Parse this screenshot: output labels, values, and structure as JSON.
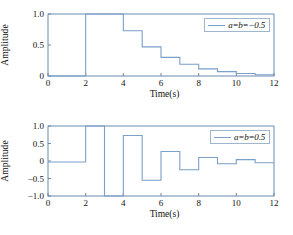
{
  "figure": {
    "background": "#ffffff",
    "line_color": "#7a9fc9",
    "axis_color": "#5b7fa6"
  },
  "chart_data": [
    {
      "type": "line",
      "id": "top",
      "title": "",
      "xlabel": "Time(s)",
      "ylabel": "Amplitude",
      "xlim": [
        0,
        12
      ],
      "ylim": [
        0,
        1.0
      ],
      "xticks": [
        0,
        2,
        4,
        6,
        8,
        10,
        12
      ],
      "xticklabels": [
        "0",
        "2",
        "4",
        "6",
        "8",
        "10",
        "12"
      ],
      "yticks": [
        0,
        0.5,
        1.0
      ],
      "yticklabels": [
        "0",
        "0.5",
        "1.0"
      ],
      "grid": false,
      "drawstyle": "steps-post",
      "legend": {
        "position": "upper right",
        "entries": [
          "a=b=−0.5"
        ]
      },
      "series": [
        {
          "name": "a=b=−0.5",
          "color": "#7a9fc9",
          "x": [
            0,
            1,
            2,
            3,
            4,
            5,
            6,
            7,
            8,
            9,
            10,
            11,
            12
          ],
          "values": [
            0,
            0,
            1.0,
            1.0,
            0.73,
            0.47,
            0.3,
            0.19,
            0.115,
            0.07,
            0.04,
            0.02,
            0.02
          ]
        }
      ]
    },
    {
      "type": "line",
      "id": "bottom",
      "title": "",
      "xlabel": "Time(s)",
      "ylabel": "Amplitude",
      "xlim": [
        0,
        12
      ],
      "ylim": [
        -1.0,
        1.0
      ],
      "xticks": [
        0,
        2,
        4,
        6,
        8,
        10,
        12
      ],
      "xticklabels": [
        "0",
        "2",
        "4",
        "6",
        "8",
        "10",
        "12"
      ],
      "yticks": [
        -1.0,
        -0.5,
        0,
        0.5,
        1.0
      ],
      "yticklabels": [
        "−1.0",
        "−0.5",
        "0",
        "0.5",
        "1.0"
      ],
      "grid": false,
      "drawstyle": "steps-post",
      "legend": {
        "position": "upper right",
        "entries": [
          "a=b=0.5"
        ]
      },
      "series": [
        {
          "name": "a=b=0.5",
          "color": "#7a9fc9",
          "x": [
            0,
            1,
            2,
            3,
            4,
            5,
            6,
            7,
            8,
            9,
            10,
            11,
            12
          ],
          "values": [
            -0.03,
            -0.03,
            1.0,
            -1.0,
            0.73,
            -0.55,
            0.27,
            -0.25,
            0.1,
            -0.08,
            0.04,
            -0.05,
            -0.05
          ]
        }
      ]
    }
  ]
}
